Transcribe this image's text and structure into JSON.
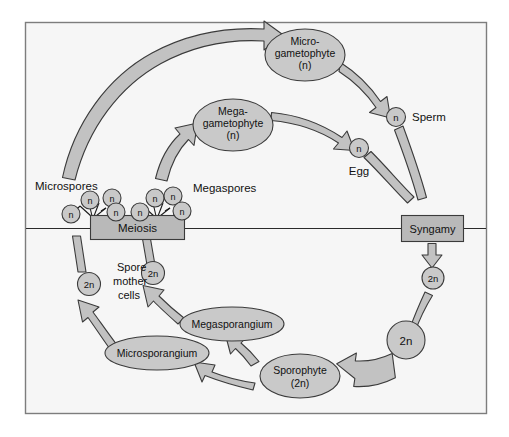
{
  "diagram": {
    "background_color": "#ffffff",
    "panel_color": "#f6f6f6",
    "shape_fill_color": "#c9c9c9",
    "box_fill_color": "#b9b9b9",
    "arrow_fill_color": "#c2c2c2",
    "outline_color": "#3b3b3b",
    "text_color": "#111111"
  },
  "nodes": {
    "microgametophyte": {
      "line1": "Micro-",
      "line2": "gametophyte",
      "line3": "(n)"
    },
    "megagametophyte": {
      "line1": "Mega-",
      "line2": "gametophyte",
      "line3": "(n)"
    },
    "sporophyte": {
      "line1": "Sporophyte",
      "line2": "(2n)"
    },
    "megasporangium": {
      "label": "Megasporangium"
    },
    "microsporangium": {
      "label": "Microsporangium"
    },
    "meiosis": {
      "label": "Meiosis"
    },
    "syngamy": {
      "label": "Syngamy"
    }
  },
  "labels": {
    "microspores": "Microspores",
    "megaspores": "Megaspores",
    "sperm": "Sperm",
    "egg": "Egg",
    "spore_mother_cells": {
      "line1": "Spore",
      "line2": "mother",
      "line3": "cells"
    }
  },
  "ploidy_markers": {
    "haploid": "n",
    "diploid": "2n",
    "microspore_circles": [
      "n",
      "n",
      "n",
      "n"
    ],
    "megaspore_circles": [
      "n",
      "n",
      "n",
      "n"
    ],
    "sperm_circle": "n",
    "egg_circle": "n",
    "zygote_small": "2n",
    "zygote_large": "2n",
    "spore_mother_cell_left": "2n",
    "spore_mother_cell_right": "2n"
  }
}
